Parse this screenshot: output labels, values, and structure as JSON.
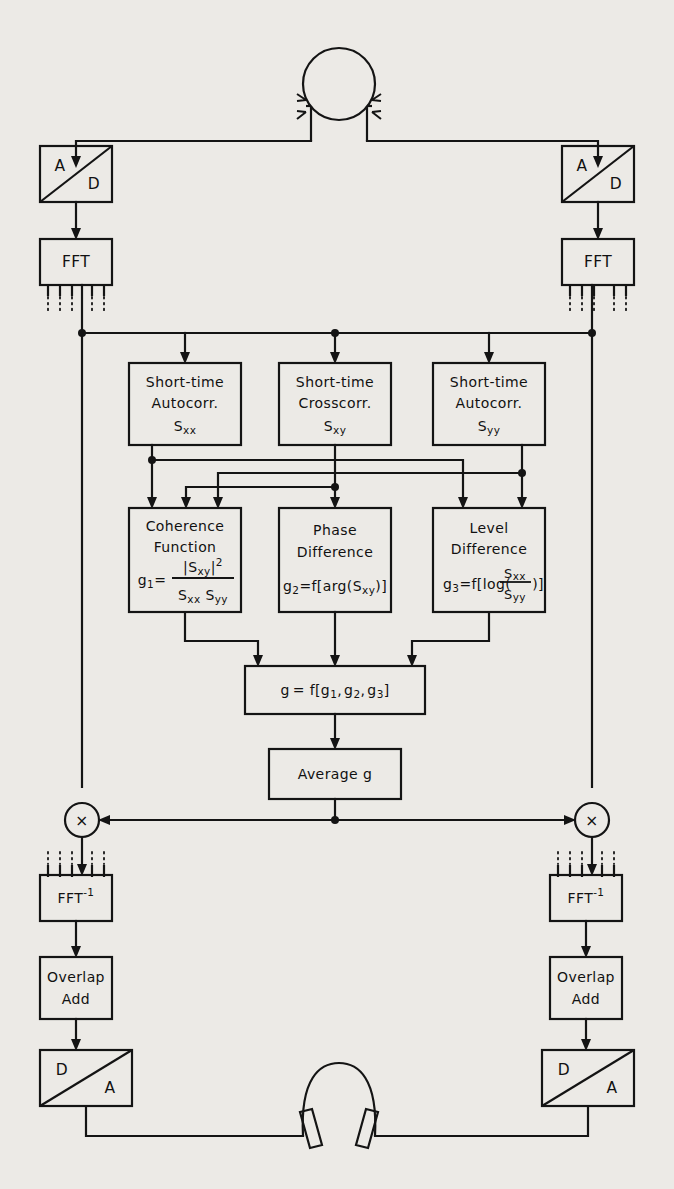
{
  "diagram": {
    "type": "signal-flow-block-diagram",
    "stroke_color": "#141414",
    "background_color": "#eceae6"
  },
  "nodes": {
    "dummy_head": {
      "name": "dummy-head-microphone",
      "label": ""
    },
    "headphones": {
      "name": "headphones-output",
      "label": ""
    },
    "ad_left": {
      "label_in": "A",
      "label_out": "D"
    },
    "ad_right": {
      "label_in": "A",
      "label_out": "D"
    },
    "fft_left": {
      "label": "FFT"
    },
    "fft_right": {
      "label": "FFT"
    },
    "autocorr_left": {
      "line1": "Short-time",
      "line2": "Autocorr.",
      "sym": "S",
      "sub": "xx"
    },
    "crosscorr": {
      "line1": "Short-time",
      "line2": "Crosscorr.",
      "sym": "S",
      "sub": "xy"
    },
    "autocorr_right": {
      "line1": "Short-time",
      "line2": "Autocorr.",
      "sym": "S",
      "sub": "yy"
    },
    "coherence": {
      "line1": "Coherence",
      "line2": "Function",
      "eq_lhs": "g",
      "eq_lhs_sub": "1",
      "eq_rel": "=",
      "num": "|S",
      "num_sub": "xy",
      "num_close": "|",
      "num_sup": "2",
      "den_a": "S",
      "den_a_sub": "xx",
      "den_b": "S",
      "den_b_sub": "yy"
    },
    "phase": {
      "line1": "Phase",
      "line2": "Difference",
      "eq_lhs": "g",
      "eq_lhs_sub": "2",
      "eq_rest": "=f[arg(S",
      "eq_sub": "xy",
      "eq_tail": ")]"
    },
    "level": {
      "line1": "Level",
      "line2": "Difference",
      "eq_lhs": "g",
      "eq_lhs_sub": "3",
      "eq_rest": "=f[log(",
      "eq_tail": ")]",
      "num": "S",
      "num_sub": "xx",
      "den": "S",
      "den_sub": "yy"
    },
    "combine": {
      "lhs": "g",
      "rel": "= f[",
      "g1": "g",
      "g1_sub": "1",
      "sep1": ",",
      "g2": "g",
      "g2_sub": "2",
      "sep2": ",",
      "g3": "g",
      "g3_sub": "3",
      "close": "]"
    },
    "average": {
      "label": "Average g"
    },
    "mult_left": {
      "symbol": "×"
    },
    "mult_right": {
      "symbol": "×"
    },
    "ifft_left": {
      "label": "FFT",
      "sup": "-1"
    },
    "ifft_right": {
      "label": "FFT",
      "sup": "-1"
    },
    "overlap_left": {
      "line1": "Overlap",
      "line2": "Add"
    },
    "overlap_right": {
      "line1": "Overlap",
      "line2": "Add"
    },
    "da_left": {
      "label_in": "D",
      "label_out": "A"
    },
    "da_right": {
      "label_in": "D",
      "label_out": "A"
    }
  }
}
